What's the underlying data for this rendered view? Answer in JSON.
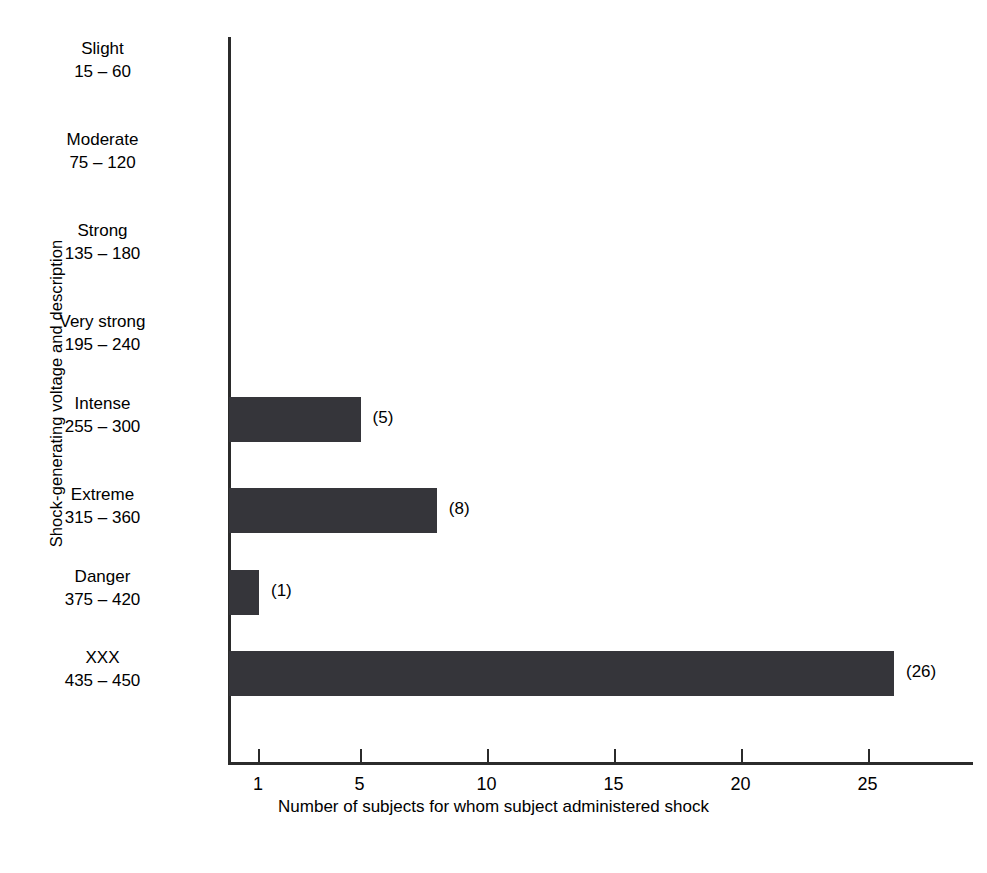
{
  "chart_data": {
    "type": "bar",
    "orientation": "horizontal",
    "title": "",
    "xlabel": "Number of subjects for whom subject administered shock",
    "ylabel": "Shock-generating voltage and description",
    "categories": [
      "Slight",
      "Moderate",
      "Strong",
      "Very strong",
      "Intense",
      "Extreme",
      "Danger",
      "XXX"
    ],
    "category_ranges": [
      "15 – 60",
      "75 – 120",
      "135 – 180",
      "195 – 240",
      "255 – 300",
      "315 – 360",
      "375 – 420",
      "435 – 450"
    ],
    "values": [
      0,
      0,
      0,
      0,
      5,
      8,
      1,
      26
    ],
    "value_labels": [
      "",
      "",
      "",
      "",
      "(5)",
      "(8)",
      "(1)",
      "(26)"
    ],
    "xticks": [
      1,
      5,
      10,
      15,
      20,
      25
    ],
    "xtick_labels": [
      "1",
      "5",
      "10",
      "15",
      "20",
      "25"
    ],
    "xlim": [
      0,
      28
    ],
    "grid": false,
    "legend": false,
    "bar_color": "#35353a",
    "axis_color": "#2b2b2b",
    "background": "#ffffff"
  },
  "axis": {
    "y_title": "Shock-generating voltage and description",
    "x_title": "Number of subjects for whom subject administered shock"
  },
  "rows": [
    {
      "name": "Slight",
      "range": "15 – 60",
      "value": 0,
      "label": ""
    },
    {
      "name": "Moderate",
      "range": "75 – 120",
      "value": 0,
      "label": ""
    },
    {
      "name": "Strong",
      "range": "135 – 180",
      "value": 0,
      "label": ""
    },
    {
      "name": "Very strong",
      "range": "195 – 240",
      "value": 0,
      "label": ""
    },
    {
      "name": "Intense",
      "range": "255 – 300",
      "value": 5,
      "label": "(5)"
    },
    {
      "name": "Extreme",
      "range": "315 – 360",
      "value": 8,
      "label": "(8)"
    },
    {
      "name": "Danger",
      "range": "375 – 420",
      "value": 1,
      "label": "(1)"
    },
    {
      "name": "XXX",
      "range": "435 – 450",
      "value": 26,
      "label": "(26)"
    }
  ],
  "xticks": [
    {
      "value": 1,
      "label": "1"
    },
    {
      "value": 5,
      "label": "5"
    },
    {
      "value": 10,
      "label": "10"
    },
    {
      "value": 15,
      "label": "15"
    },
    {
      "value": 20,
      "label": "20"
    },
    {
      "value": 25,
      "label": "25"
    }
  ]
}
